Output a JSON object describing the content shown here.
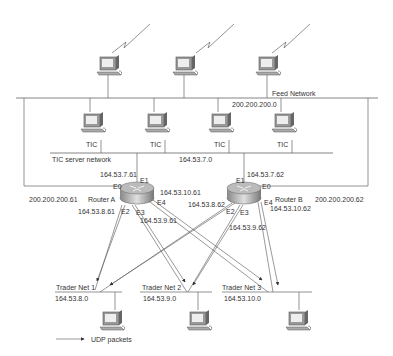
{
  "diagram": {
    "networks": {
      "feed": {
        "name": "Feed Network",
        "address": "200.200.200.0"
      },
      "tic_server": {
        "name": "TIC server network",
        "address": "164.53.7.0"
      },
      "trader1": {
        "name": "Trader Net 1",
        "address": "164.53.8.0"
      },
      "trader2": {
        "name": "Trader Net 2",
        "address": "164.53.9.0"
      },
      "trader3": {
        "name": "Trader Net 3",
        "address": "164.53.10.0"
      }
    },
    "tic_servers": [
      {
        "label": "TIC"
      },
      {
        "label": "TIC"
      },
      {
        "label": "TIC"
      },
      {
        "label": "TIC"
      }
    ],
    "router_a": {
      "name": "Router A",
      "e0": "E0",
      "e1": "E1",
      "e2": "E2",
      "e3": "E3",
      "e4": "E4",
      "e0_addr": "200.200.200.61",
      "e1_addr": "164.53.7.61",
      "e2_addr": "164.53.8.61",
      "e3_addr": "164.53.9.61",
      "e4_addr": "164.53.10.61"
    },
    "router_b": {
      "name": "Router B",
      "e0": "E0",
      "e1": "E1",
      "e2": "E2",
      "e3": "E3",
      "e4": "E4",
      "e0_addr": "200.200.200.62",
      "e1_addr": "164.53.7.62",
      "e2_addr": "164.53.8.62",
      "e3_addr": "164.53.9.62",
      "e4_addr": "164.53.10.62"
    },
    "legend": {
      "label": "UDP packets"
    },
    "colors": {
      "line": "#555555",
      "device_face": "#d8d8d8",
      "device_dark": "#777777"
    }
  }
}
